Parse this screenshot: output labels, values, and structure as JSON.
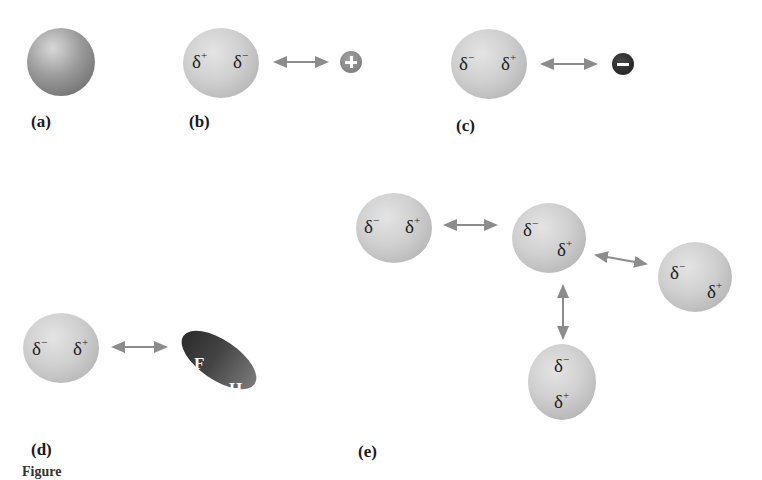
{
  "figure": {
    "panels": [
      {
        "id": "a",
        "label": "(a)",
        "description": "nonpolar atom"
      },
      {
        "id": "b",
        "label": "(b)",
        "left_charge": "δ",
        "left_sign": "+",
        "right_charge": "δ",
        "right_sign": "−",
        "ion_symbol": "+"
      },
      {
        "id": "c",
        "label": "(c)",
        "left_charge": "δ",
        "left_sign": "−",
        "right_charge": "δ",
        "right_sign": "+",
        "ion_symbol": "−"
      },
      {
        "id": "d",
        "label": "(d)",
        "left_charge": "δ",
        "left_sign": "−",
        "right_charge": "δ",
        "right_sign": "+",
        "molecule": {
          "atom1": "F",
          "atom2": "H"
        }
      },
      {
        "id": "e",
        "label": "(e)",
        "atoms": [
          {
            "top_charge": "δ",
            "top_sign": "−",
            "bottom_charge": "δ",
            "bottom_sign": "+"
          },
          {
            "top_charge": "δ",
            "top_sign": "−",
            "bottom_charge": "δ",
            "bottom_sign": "+"
          },
          {
            "top_charge": "δ",
            "top_sign": "−",
            "bottom_charge": "δ",
            "bottom_sign": "+"
          },
          {
            "top_charge": "δ",
            "top_sign": "−",
            "bottom_charge": "δ",
            "bottom_sign": "+"
          }
        ]
      }
    ],
    "caption": "Figure"
  },
  "colors": {
    "arrow": "#8c8c8c",
    "atom_light": "#d4d4d4",
    "atom_dark": "#5f5f5f",
    "ion_plus": "#7f7f7f",
    "ion_minus": "#262626"
  }
}
